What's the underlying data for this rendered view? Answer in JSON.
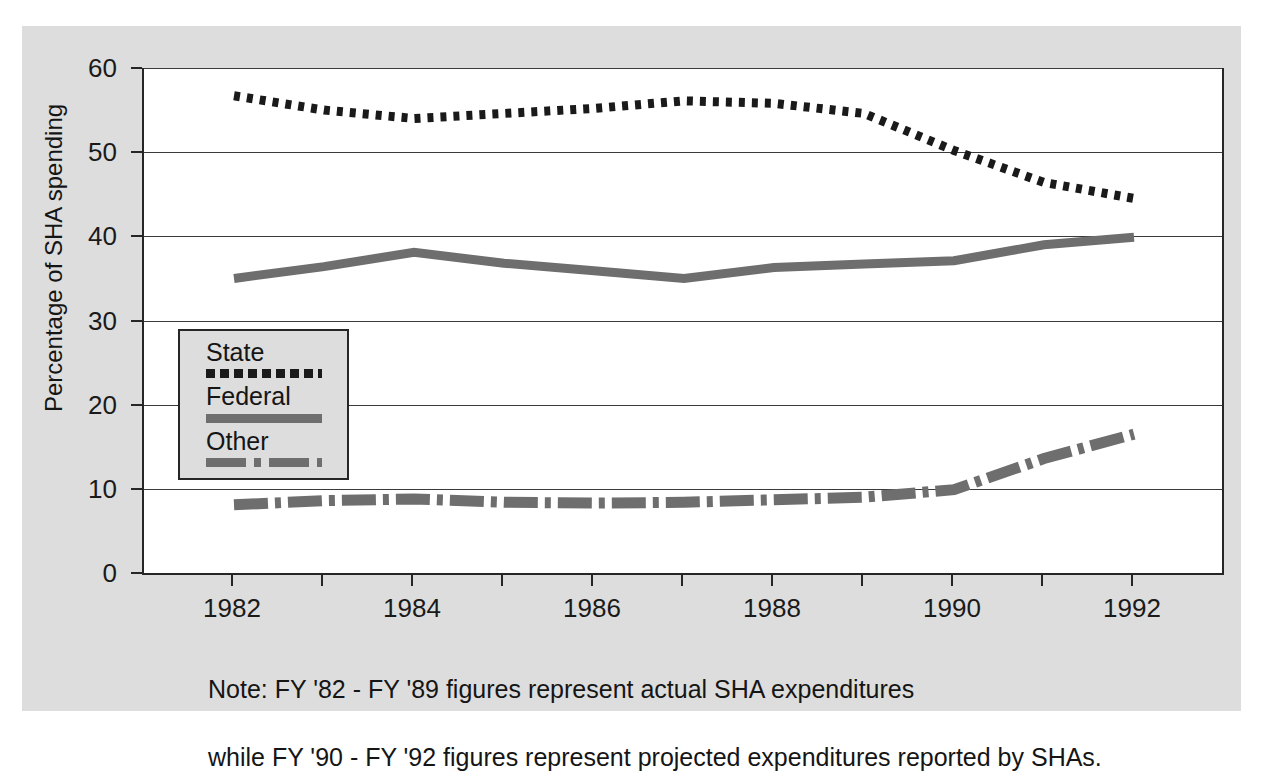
{
  "chart_data": {
    "type": "line",
    "title": "",
    "xlabel": "",
    "ylabel": "Percentage of SHA spending",
    "x": [
      1982,
      1983,
      1984,
      1985,
      1986,
      1987,
      1988,
      1989,
      1990,
      1991,
      1992
    ],
    "xlim": [
      1981,
      1993
    ],
    "ylim": [
      0,
      60
    ],
    "ytick_labels": [
      "0",
      "10",
      "20",
      "30",
      "40",
      "50",
      "60"
    ],
    "ytick_values": [
      0,
      10,
      20,
      30,
      40,
      50,
      60
    ],
    "xtick_labels": [
      "1982",
      "1984",
      "1986",
      "1988",
      "1990",
      "1992"
    ],
    "xtick_values": [
      1982,
      1984,
      1986,
      1988,
      1990,
      1992
    ],
    "grid": "horizontal",
    "legend_position": "inside-lower-left",
    "series": [
      {
        "name": "State",
        "style": "dotted",
        "color": "#1a1a1a",
        "values": [
          56.7,
          55.0,
          54.0,
          54.6,
          55.2,
          56.1,
          55.8,
          54.6,
          50.2,
          46.4,
          44.5
        ]
      },
      {
        "name": "Federal",
        "style": "solid",
        "color": "#6e6e6e",
        "values": [
          35.0,
          36.4,
          38.1,
          36.8,
          35.9,
          35.0,
          36.3,
          36.7,
          37.1,
          39.0,
          39.9
        ]
      },
      {
        "name": "Other",
        "style": "dash-dot",
        "color": "#6e6e6e",
        "values": [
          8.1,
          8.6,
          8.8,
          8.4,
          8.3,
          8.4,
          8.7,
          9.0,
          9.9,
          13.6,
          16.5
        ]
      }
    ],
    "annotations": [
      "Note: FY '82 - FY '89 figures represent actual SHA expenditures",
      "while FY '90 - FY '92 figures represent projected expenditures reported by SHAs."
    ]
  },
  "axis": {
    "ylabel": "Percentage of SHA spending",
    "yticks": [
      "60",
      "50",
      "40",
      "30",
      "20",
      "10",
      "0"
    ],
    "xticks": [
      "1982",
      "1984",
      "1986",
      "1988",
      "1990",
      "1992"
    ]
  },
  "legend": {
    "entries": [
      {
        "label": "State"
      },
      {
        "label": "Federal"
      },
      {
        "label": "Other"
      }
    ]
  },
  "note": {
    "line1": "Note: FY '82 - FY '89 figures represent actual SHA expenditures",
    "line2": "while FY '90 - FY '92 figures represent projected expenditures reported by SHAs."
  },
  "colors": {
    "figure_background": "#dddddd",
    "plot_background": "#ffffff",
    "axis": "#262626",
    "state_line": "#1a1a1a",
    "federal_line": "#6e6e6e",
    "other_line": "#6e6e6e"
  }
}
